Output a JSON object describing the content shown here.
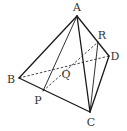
{
  "diagram": {
    "colors": {
      "line": "#1a1a1a",
      "label": "#333333",
      "background": "#ffffff"
    },
    "points": {
      "A": {
        "label": "A",
        "x": 77,
        "y": 16,
        "lx": 77,
        "ly": 11
      },
      "B": {
        "label": "B",
        "x": 19,
        "y": 78,
        "lx": 11,
        "ly": 83
      },
      "C": {
        "label": "C",
        "x": 90,
        "y": 112,
        "lx": 91,
        "ly": 126
      },
      "D": {
        "label": "D",
        "x": 109,
        "y": 56,
        "lx": 115,
        "ly": 60
      },
      "R": {
        "label": "R",
        "x": 98,
        "y": 42,
        "lx": 102,
        "ly": 39
      },
      "P": {
        "label": "P",
        "x": 43,
        "y": 91,
        "lx": 38,
        "ly": 104
      },
      "Q": {
        "label": "Q",
        "x": 63,
        "y": 67,
        "lx": 66,
        "ly": 78
      }
    },
    "solid_edges": [
      [
        "A",
        "B"
      ],
      [
        "A",
        "C"
      ],
      [
        "A",
        "D"
      ],
      [
        "B",
        "C"
      ],
      [
        "C",
        "D"
      ],
      [
        "A",
        "P"
      ],
      [
        "R",
        "C"
      ]
    ],
    "dashed_edges": [
      [
        "B",
        "D"
      ],
      [
        "P",
        "R"
      ]
    ]
  }
}
